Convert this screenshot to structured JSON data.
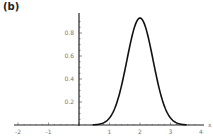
{
  "panel_label": "(b)",
  "chart_data": {
    "type": "line",
    "title": "",
    "xlabel": "x",
    "ylabel": "",
    "xlim": [
      -2.2,
      4.2
    ],
    "ylim": [
      0,
      0.95
    ],
    "x_ticks": [
      -2,
      -1,
      1,
      2,
      3,
      4
    ],
    "x_tick_labels": [
      "-2",
      "-1",
      "1",
      "2",
      "3",
      "4"
    ],
    "y_ticks": [
      0.2,
      0.4,
      0.6,
      0.8
    ],
    "y_tick_labels": [
      "0.2",
      "0.4",
      "0.6",
      "0.8"
    ],
    "grid": false,
    "legend": null,
    "series": [
      {
        "name": "normal pdf (mean 2, sd ~0.43)",
        "x": [
          0.6,
          0.8,
          1.0,
          1.2,
          1.4,
          1.6,
          1.8,
          2.0,
          2.2,
          2.4,
          2.6,
          2.8,
          3.0,
          3.2,
          3.4
        ],
        "y": [
          0.0,
          0.02,
          0.06,
          0.16,
          0.35,
          0.6,
          0.84,
          0.93,
          0.84,
          0.6,
          0.35,
          0.16,
          0.06,
          0.02,
          0.0
        ]
      }
    ]
  }
}
